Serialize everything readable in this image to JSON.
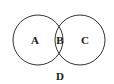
{
  "diagram": {
    "type": "venn",
    "circles": [
      {
        "name": "left",
        "cx": 38,
        "cy": 40,
        "r": 25
      },
      {
        "name": "right",
        "cx": 80,
        "cy": 40,
        "r": 25
      }
    ],
    "regions": {
      "left_only": "A",
      "intersection": "B",
      "right_only": "C",
      "outside": "D"
    },
    "stroke_color": "#333333",
    "background": "#ffffff"
  }
}
